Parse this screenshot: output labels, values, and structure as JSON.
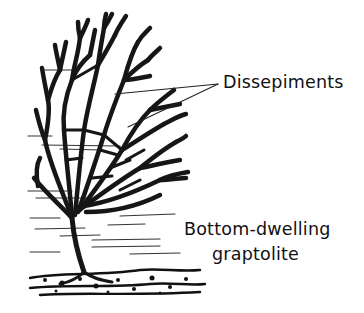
{
  "figure": {
    "labels": {
      "dissepiments": "Dissepiments",
      "caption_line1": "Bottom-dwelling",
      "caption_line2": "graptolite"
    },
    "colors": {
      "ink": "#141414",
      "background": "#ffffff"
    }
  }
}
